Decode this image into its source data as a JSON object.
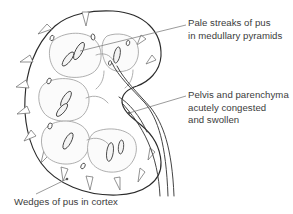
{
  "figure": {
    "background_color": "#ffffff",
    "outline_color": "#2b2b2b",
    "inner_line_color": "#9a9a9a",
    "pus_fill_color": "#f2f2f2",
    "text_color": "#3b3b3b",
    "leader_line_color": "#7a7a7a"
  },
  "annotations": [
    {
      "id": "pale-streaks",
      "lines": [
        "Pale streaks of pus",
        "in medullary pyramids"
      ],
      "leader": {
        "x1": 186,
        "y1": 25,
        "x2": 80,
        "y2": 51
      }
    },
    {
      "id": "pelvis",
      "lines": [
        "Pelvis and parenchyma",
        "acutely congested",
        "and swollen"
      ],
      "leader": {
        "x1": 186,
        "y1": 96,
        "x2": 129,
        "y2": 113
      }
    },
    {
      "id": "wedges",
      "lines": [
        "Wedges of pus in cortex"
      ],
      "leader": {
        "x1": 36,
        "y1": 194,
        "x2": 67,
        "y2": 179
      }
    }
  ],
  "structures": {
    "cortex_label": "cortex",
    "medullary_pyramids_label": "medullary pyramids",
    "renal_pelvis_label": "renal pelvis",
    "ureter_label": "ureter"
  }
}
